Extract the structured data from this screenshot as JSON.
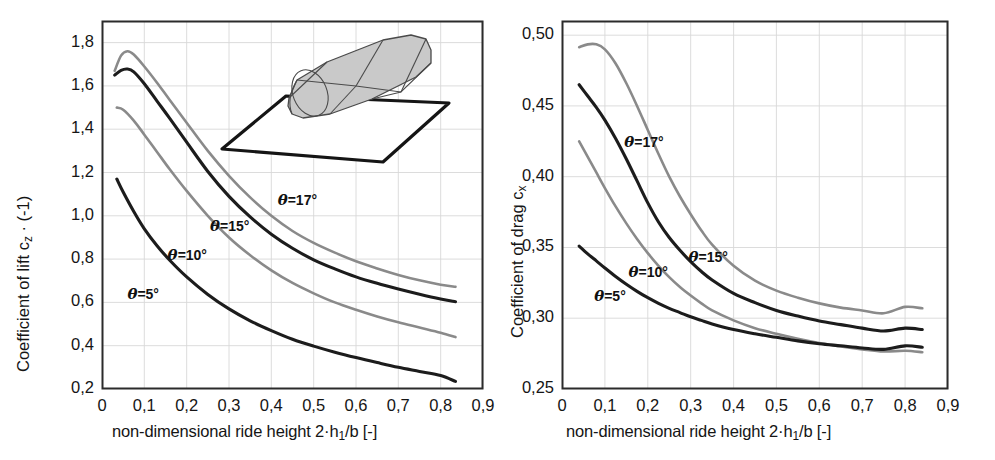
{
  "figure": {
    "background": "#ffffff",
    "width": 995,
    "height": 460
  },
  "colors": {
    "dark_curve": "#1c1c1c",
    "light_curve": "#8a8a8a",
    "frame": "#2b2b2b",
    "grid": "#d8d8d8",
    "inset_fill": "#c9c9c9",
    "inset_stroke": "#4a4a4a",
    "ground_stroke": "#151515",
    "text": "#151515"
  },
  "inset": {
    "name": "simplified-vehicle-body-over-ground-plane",
    "description": "grey shaded rounded box body above a ground plate"
  },
  "panels": [
    {
      "id": "lift",
      "ylabel": "Coefficient of lift c_z · (-1)",
      "ylabel_parts": {
        "pre": "Coefficient of lift c",
        "sub": "z",
        "post": " · (-1)"
      },
      "xlabel": "non-dimensional ride height 2·h_1/b [-]",
      "xlabel_parts": {
        "pre": "non-dimensional ride height 2·h",
        "sub": "1",
        "post": "/b [-]"
      },
      "yticks": [
        "0,2",
        "0,4",
        "0,6",
        "0,8",
        "1,0",
        "1,2",
        "1,4",
        "1,6",
        "1,8"
      ],
      "xticks": [
        "0",
        "0,1",
        "0,2",
        "0,3",
        "0,4",
        "0,5",
        "0,6",
        "0,7",
        "0,8",
        "0,9"
      ],
      "curve_labels": [
        {
          "text": "=17°",
          "symbol": "θ"
        },
        {
          "text": "=15°",
          "symbol": "θ"
        },
        {
          "text": "=10°",
          "symbol": "θ"
        },
        {
          "text": "=5°",
          "symbol": "θ"
        }
      ]
    },
    {
      "id": "drag",
      "ylabel": "Coefficient of drag c_x",
      "ylabel_parts": {
        "pre": "Coefficient of drag c",
        "sub": "x",
        "post": ""
      },
      "xlabel": "non-dimensional ride height 2·h_1/b [-]",
      "xlabel_parts": {
        "pre": "non-dimensional ride height 2·h",
        "sub": "1",
        "post": "/b [-]"
      },
      "yticks": [
        "0,25",
        "0,30",
        "0,35",
        "0,40",
        "0,45",
        "0,50"
      ],
      "xticks": [
        "0",
        "0,1",
        "0,2",
        "0,3",
        "0,4",
        "0,5",
        "0,6",
        "0,7",
        "0,8",
        "0,9"
      ],
      "curve_labels": [
        {
          "text": "=17°",
          "symbol": "θ"
        },
        {
          "text": "=15°",
          "symbol": "θ"
        },
        {
          "text": "=10°",
          "symbol": "θ"
        },
        {
          "text": "=5°",
          "symbol": "θ"
        }
      ]
    }
  ],
  "chart_data": [
    {
      "type": "line",
      "id": "lift",
      "title": "",
      "xlabel": "non-dimensional ride height 2·h1/b [-]",
      "ylabel": "Coefficient of lift cz · (-1)",
      "xlim": [
        0,
        0.9
      ],
      "ylim": [
        0.2,
        1.9
      ],
      "xticks": [
        0,
        0.1,
        0.2,
        0.3,
        0.4,
        0.5,
        0.6,
        0.7,
        0.8,
        0.9
      ],
      "yticks": [
        0.2,
        0.4,
        0.6,
        0.8,
        1.0,
        1.2,
        1.4,
        1.6,
        1.8
      ],
      "grid": true,
      "legend": "inline-curve-labels",
      "series": [
        {
          "name": "θ =17°",
          "color": "#8a8a8a",
          "x": [
            0.03,
            0.045,
            0.06,
            0.075,
            0.1,
            0.13,
            0.16,
            0.2,
            0.25,
            0.3,
            0.35,
            0.4,
            0.45,
            0.5,
            0.55,
            0.6,
            0.65,
            0.7,
            0.75,
            0.8,
            0.835
          ],
          "y": [
            1.67,
            1.74,
            1.76,
            1.745,
            1.69,
            1.615,
            1.535,
            1.43,
            1.3,
            1.185,
            1.085,
            1.0,
            0.93,
            0.875,
            0.83,
            0.79,
            0.757,
            0.727,
            0.702,
            0.682,
            0.672
          ]
        },
        {
          "name": "θ =15°",
          "color": "#1c1c1c",
          "x": [
            0.03,
            0.045,
            0.06,
            0.075,
            0.1,
            0.13,
            0.16,
            0.2,
            0.25,
            0.3,
            0.35,
            0.4,
            0.45,
            0.5,
            0.55,
            0.6,
            0.65,
            0.7,
            0.75,
            0.8,
            0.835
          ],
          "y": [
            1.65,
            1.672,
            1.678,
            1.665,
            1.61,
            1.53,
            1.45,
            1.34,
            1.205,
            1.09,
            0.995,
            0.915,
            0.85,
            0.797,
            0.755,
            0.718,
            0.688,
            0.662,
            0.638,
            0.616,
            0.603
          ]
        },
        {
          "name": "θ =10°",
          "color": "#8a8a8a",
          "x": [
            0.035,
            0.05,
            0.075,
            0.1,
            0.13,
            0.16,
            0.2,
            0.25,
            0.3,
            0.35,
            0.4,
            0.45,
            0.5,
            0.55,
            0.6,
            0.65,
            0.7,
            0.75,
            0.8,
            0.835
          ],
          "y": [
            1.5,
            1.49,
            1.44,
            1.375,
            1.295,
            1.215,
            1.115,
            1.0,
            0.9,
            0.818,
            0.748,
            0.69,
            0.642,
            0.6,
            0.566,
            0.535,
            0.508,
            0.484,
            0.46,
            0.44
          ]
        },
        {
          "name": "θ =5°",
          "color": "#1c1c1c",
          "x": [
            0.035,
            0.05,
            0.075,
            0.1,
            0.13,
            0.16,
            0.2,
            0.25,
            0.3,
            0.35,
            0.4,
            0.45,
            0.5,
            0.55,
            0.6,
            0.65,
            0.7,
            0.75,
            0.8,
            0.835
          ],
          "y": [
            1.17,
            1.11,
            1.02,
            0.94,
            0.862,
            0.795,
            0.718,
            0.637,
            0.57,
            0.515,
            0.47,
            0.43,
            0.398,
            0.37,
            0.345,
            0.322,
            0.3,
            0.281,
            0.262,
            0.235
          ]
        }
      ]
    },
    {
      "type": "line",
      "id": "drag",
      "title": "",
      "xlabel": "non-dimensional ride height 2·h1/b [-]",
      "ylabel": "Coefficient of drag cx",
      "xlim": [
        0,
        0.9
      ],
      "ylim": [
        0.25,
        0.51
      ],
      "xticks": [
        0,
        0.1,
        0.2,
        0.3,
        0.4,
        0.5,
        0.6,
        0.7,
        0.8,
        0.9
      ],
      "yticks": [
        0.25,
        0.3,
        0.35,
        0.4,
        0.45,
        0.5
      ],
      "grid": true,
      "legend": "inline-curve-labels",
      "series": [
        {
          "name": "θ =17°",
          "color": "#8a8a8a",
          "x": [
            0.04,
            0.06,
            0.08,
            0.1,
            0.125,
            0.15,
            0.175,
            0.2,
            0.225,
            0.25,
            0.275,
            0.3,
            0.325,
            0.35,
            0.4,
            0.45,
            0.5,
            0.55,
            0.6,
            0.65,
            0.7,
            0.75,
            0.8,
            0.84
          ],
          "y": [
            0.4915,
            0.4935,
            0.4935,
            0.49,
            0.48,
            0.466,
            0.45,
            0.433,
            0.416,
            0.4,
            0.386,
            0.3735,
            0.362,
            0.352,
            0.337,
            0.3265,
            0.3195,
            0.3145,
            0.3105,
            0.3075,
            0.3055,
            0.3035,
            0.308,
            0.307
          ]
        },
        {
          "name": "θ =15°",
          "color": "#1c1c1c",
          "x": [
            0.04,
            0.06,
            0.08,
            0.1,
            0.125,
            0.15,
            0.175,
            0.2,
            0.225,
            0.25,
            0.275,
            0.3,
            0.325,
            0.35,
            0.4,
            0.45,
            0.5,
            0.55,
            0.6,
            0.65,
            0.7,
            0.75,
            0.8,
            0.84
          ],
          "y": [
            0.465,
            0.457,
            0.449,
            0.44,
            0.427,
            0.4125,
            0.397,
            0.3815,
            0.368,
            0.357,
            0.348,
            0.34,
            0.333,
            0.327,
            0.3175,
            0.311,
            0.3055,
            0.3015,
            0.298,
            0.2955,
            0.293,
            0.291,
            0.293,
            0.292
          ]
        },
        {
          "name": "θ =10°",
          "color": "#8a8a8a",
          "x": [
            0.04,
            0.06,
            0.08,
            0.1,
            0.125,
            0.15,
            0.175,
            0.2,
            0.225,
            0.25,
            0.275,
            0.3,
            0.325,
            0.35,
            0.4,
            0.45,
            0.5,
            0.55,
            0.6,
            0.65,
            0.7,
            0.75,
            0.8,
            0.84
          ],
          "y": [
            0.425,
            0.414,
            0.403,
            0.392,
            0.379,
            0.367,
            0.356,
            0.346,
            0.337,
            0.329,
            0.322,
            0.316,
            0.3105,
            0.3055,
            0.2985,
            0.293,
            0.289,
            0.2855,
            0.2825,
            0.28,
            0.278,
            0.2765,
            0.277,
            0.276
          ]
        },
        {
          "name": "θ =5°",
          "color": "#1c1c1c",
          "x": [
            0.04,
            0.06,
            0.08,
            0.1,
            0.125,
            0.15,
            0.175,
            0.2,
            0.225,
            0.25,
            0.275,
            0.3,
            0.325,
            0.35,
            0.4,
            0.45,
            0.5,
            0.55,
            0.6,
            0.65,
            0.7,
            0.75,
            0.8,
            0.84
          ],
          "y": [
            0.351,
            0.3455,
            0.3405,
            0.3355,
            0.3295,
            0.324,
            0.319,
            0.3145,
            0.3105,
            0.307,
            0.304,
            0.301,
            0.2985,
            0.296,
            0.292,
            0.289,
            0.2865,
            0.284,
            0.282,
            0.2805,
            0.279,
            0.278,
            0.2805,
            0.2795
          ]
        }
      ]
    }
  ]
}
